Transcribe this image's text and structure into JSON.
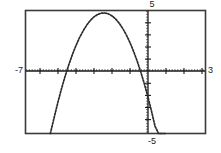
{
  "view": {
    "title": "graphing-calculator-plot",
    "background_color": "#ffffff",
    "ink_color": "#1a1a1a"
  },
  "labels": {
    "ymax": "5",
    "ymin": "-5",
    "xmin": "-7",
    "xmax": "3"
  },
  "chart_data": {
    "type": "line",
    "title": "",
    "xlabel": "",
    "ylabel": "",
    "xlim": [
      -7,
      3
    ],
    "ylim": [
      -5,
      5
    ],
    "grid": false,
    "legend": null,
    "axes": {
      "x_axis_at_y": 0,
      "y_axis_at_x": 0,
      "tick_spacing_x": 1,
      "tick_spacing_y": 1,
      "tick_style": "dotted-marks",
      "frame": true
    },
    "tick_labels": {
      "x": [
        -7,
        3
      ],
      "y": [
        -5,
        5
      ]
    },
    "series": [
      {
        "name": "parabola",
        "shape": "downward-opening parabola",
        "vertex": [
          -2.4,
          4.2
        ],
        "x_intercepts": [
          -4.9,
          0.05
        ],
        "x": [
          -5.62,
          -5.4,
          -5.2,
          -5.0,
          -4.8,
          -4.6,
          -4.4,
          -4.2,
          -4.0,
          -3.8,
          -3.6,
          -3.4,
          -3.2,
          -3.0,
          -2.8,
          -2.6,
          -2.4,
          -2.2,
          -2.0,
          -1.8,
          -1.6,
          -1.4,
          -1.2,
          -1.0,
          -0.8,
          -0.6,
          -0.4,
          -0.2,
          0.0,
          0.2,
          0.4,
          0.6,
          0.75
        ],
        "y": [
          -5.0,
          -3.65,
          -2.46,
          -1.36,
          -0.35,
          0.57,
          1.4,
          2.14,
          2.79,
          3.34,
          3.81,
          4.19,
          4.48,
          4.67,
          4.78,
          4.8,
          4.73,
          4.57,
          4.32,
          3.98,
          3.54,
          3.02,
          2.41,
          1.7,
          0.91,
          0.02,
          -0.95,
          -2.02,
          -3.18,
          -4.43,
          -5.0,
          -5.0,
          -5.0
        ]
      }
    ]
  }
}
